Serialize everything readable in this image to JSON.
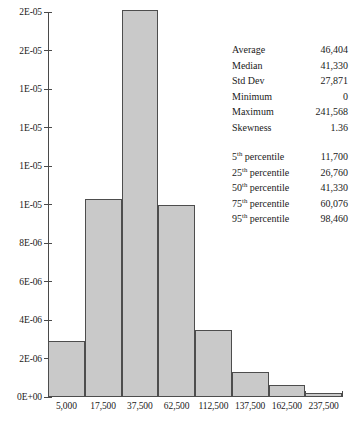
{
  "chart_data": {
    "type": "bar",
    "title": "",
    "subtitle": "",
    "xlabel": "",
    "ylabel": "",
    "grid": false,
    "legend": "none",
    "categories": [
      "5,000",
      "17,500",
      "37,500",
      "62,500",
      "112,500",
      "137,500",
      "162,500",
      "237,500"
    ],
    "bin_centers": [
      5000,
      17500,
      37500,
      62500,
      112500,
      137500,
      162500,
      237500
    ],
    "values": [
      2.9e-06,
      1.03e-05,
      2.01e-05,
      1e-05,
      3.5e-06,
      1.3e-06,
      6e-07,
      2e-07
    ],
    "ylim": [
      0,
      2e-05
    ],
    "ytick_values": [
      2e-05,
      1.8e-05,
      1.6e-05,
      1.4e-05,
      1.2e-05,
      1e-05,
      8e-06,
      6e-06,
      4e-06,
      2e-06,
      0
    ],
    "ytick_labels": [
      "2E-05",
      "2E-05",
      "1E-05",
      "1E-05",
      "1E-05",
      "1E-05",
      "8E-06",
      "6E-06",
      "4E-06",
      "2E-06",
      "0E+00"
    ],
    "bar_color": "#c9c9c9",
    "bar_edge_color": "#4d4d4d",
    "axis_color": "#4a4a4a"
  },
  "stats": {
    "summary": [
      {
        "label": "Average",
        "value": "46,404"
      },
      {
        "label": "Median",
        "value": "41,330"
      },
      {
        "label": "Std Dev",
        "value": "27,871"
      },
      {
        "label": "Minimum",
        "value": "0"
      },
      {
        "label": "Maximum",
        "value": "241,568"
      },
      {
        "label": "Skewness",
        "value": "1.36"
      }
    ],
    "percentiles": [
      {
        "rank": "5",
        "suffix": "th",
        "label_tail": " percentile",
        "value": "11,700"
      },
      {
        "rank": "25",
        "suffix": "th",
        "label_tail": " percentile",
        "value": "26,760"
      },
      {
        "rank": "50",
        "suffix": "th",
        "label_tail": " percentile",
        "value": "41,330"
      },
      {
        "rank": "75",
        "suffix": "th",
        "label_tail": " percentile",
        "value": "60,076"
      },
      {
        "rank": "95",
        "suffix": "th",
        "label_tail": " percentile",
        "value": "98,460"
      }
    ]
  }
}
